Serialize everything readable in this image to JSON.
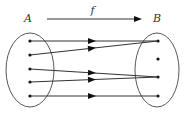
{
  "diagram": {
    "title_arrow": {
      "label": "f",
      "x1": 47,
      "x2": 138,
      "y": 19
    },
    "sets": [
      {
        "label": "A",
        "label_x": 24,
        "label_y": 22,
        "cx": 30,
        "cy": 70,
        "rx": 24,
        "ry": 37,
        "points": [
          {
            "x": 30,
            "y": 41
          },
          {
            "x": 30,
            "y": 55
          },
          {
            "x": 30,
            "y": 69
          },
          {
            "x": 30,
            "y": 82
          },
          {
            "x": 30,
            "y": 96
          }
        ]
      },
      {
        "label": "B",
        "label_x": 153,
        "label_y": 22,
        "cx": 157,
        "cy": 70,
        "rx": 22,
        "ry": 37,
        "points": [
          {
            "x": 158,
            "y": 41
          },
          {
            "x": 158,
            "y": 59
          },
          {
            "x": 158,
            "y": 77
          },
          {
            "x": 158,
            "y": 96
          }
        ]
      }
    ],
    "mappings": [
      {
        "from": 0,
        "to": 0
      },
      {
        "from": 1,
        "to": 0
      },
      {
        "from": 2,
        "to": 2
      },
      {
        "from": 3,
        "to": 2
      },
      {
        "from": 4,
        "to": 3
      }
    ],
    "arrowhead_x": 92
  }
}
